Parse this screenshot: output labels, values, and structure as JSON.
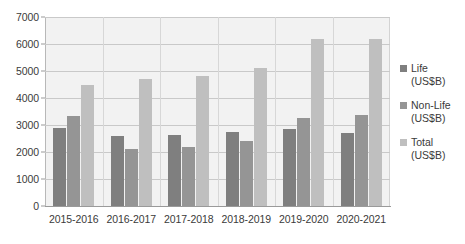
{
  "chart_data": {
    "type": "bar",
    "title": "",
    "subtitle": "",
    "xlabel": "",
    "ylabel": "",
    "ylim": [
      0,
      7000
    ],
    "ytick_step": 1000,
    "yticks": [
      7000,
      6000,
      5000,
      4000,
      3000,
      2000,
      1000,
      0
    ],
    "grid": true,
    "legend_position": "right",
    "categories": [
      "2015-2016",
      "2016-2017",
      "2017-2018",
      "2018-2019",
      "2019-2020",
      "2020-2021"
    ],
    "series": [
      {
        "name": "Life",
        "unit": "(US$B)",
        "color": "#7f7f7f",
        "values": [
          2900,
          2600,
          2620,
          2750,
          2850,
          2700
        ]
      },
      {
        "name": "Non-Life",
        "unit": "(US$B)",
        "color": "#959595",
        "values": [
          3350,
          2100,
          2180,
          2400,
          3250,
          3380
        ]
      },
      {
        "name": "Total",
        "unit": "(US$B)",
        "color": "#bfbfbf",
        "values": [
          4500,
          4700,
          4800,
          5130,
          6180,
          6180
        ]
      }
    ]
  },
  "legend": {
    "items": [
      {
        "label": "Life",
        "unit": "(US$B)",
        "swatch": "sw-life"
      },
      {
        "label": "Non-Life",
        "unit": "(US$B)",
        "swatch": "sw-nonlife"
      },
      {
        "label": "Total",
        "unit": "(US$B)",
        "swatch": "sw-total"
      }
    ]
  },
  "colors": {
    "plot_background": "#f2f2f2",
    "gridline": "#c9c9c9",
    "axis": "#9a9a9a",
    "text": "#3a3a3a"
  }
}
